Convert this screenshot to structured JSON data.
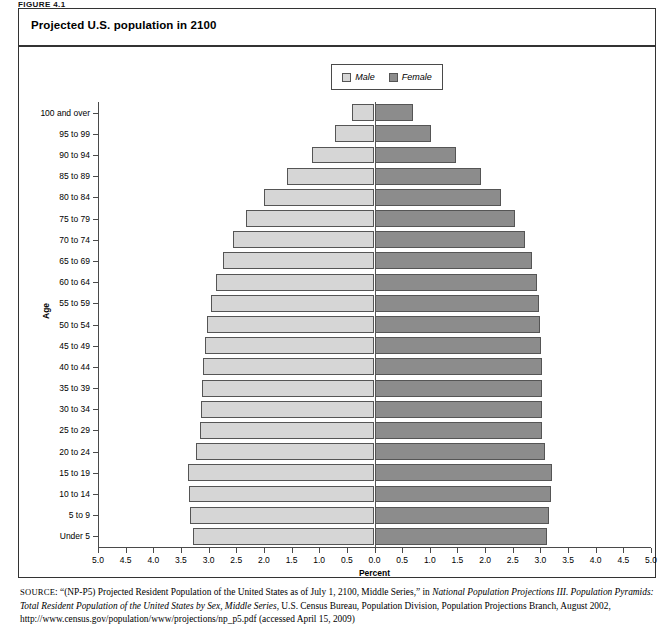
{
  "figure_label": "FIGURE 4.1",
  "title": "Projected U.S. population in 2100",
  "legend": {
    "male": "Male",
    "female": "Female"
  },
  "axes": {
    "xlabel": "Percent",
    "ylabel": "Age",
    "xticks": [
      "5.0",
      "4.5",
      "4.0",
      "3.5",
      "3.0",
      "2.5",
      "2.0",
      "1.5",
      "1.0",
      "0.5",
      "0.0",
      "0.5",
      "1.0",
      "1.5",
      "2.0",
      "2.5",
      "3.0",
      "3.5",
      "4.0",
      "4.5",
      "5.0"
    ],
    "xmax": 5.0
  },
  "colors": {
    "male": "#d6d6d6",
    "female": "#8c8c8c",
    "border": "#555555",
    "frame": "#333333"
  },
  "source": {
    "prefix": "SOURCE",
    "part1": ": “(NP-P5) Projected Resident Population of the United States as of July 1, 2100, Middle Series,” in ",
    "italic1": "National Population Projections III. Population Pyramids: Total Resident Population of the United States by Sex, Middle Series",
    "part2": ", U.S. Census Bureau, Population Division, Population Projections Branch, August 2002, http://www.census.gov/population/www/projections/np_p5.pdf (accessed April 15, 2009)"
  },
  "chart_data": {
    "type": "bar",
    "orientation": "population-pyramid",
    "title": "Projected U.S. population in 2100",
    "xlabel": "Percent",
    "ylabel": "Age",
    "xlim": [
      -5.0,
      5.0
    ],
    "grid": false,
    "legend_position": "top-center",
    "categories": [
      "Under 5",
      "5 to 9",
      "10 to 14",
      "15 to 19",
      "20 to 24",
      "25 to 29",
      "30 to 34",
      "35 to 39",
      "40 to 44",
      "45 to 49",
      "50 to 54",
      "55 to 59",
      "60 to 64",
      "65 to 69",
      "70 to 74",
      "75 to 79",
      "80 to 84",
      "85 to 89",
      "90 to 94",
      "95 to 99",
      "100 and over"
    ],
    "series": [
      {
        "name": "Male",
        "side": "left",
        "values": [
          3.29,
          3.33,
          3.36,
          3.38,
          3.22,
          3.15,
          3.14,
          3.12,
          3.1,
          3.07,
          3.02,
          2.96,
          2.87,
          2.74,
          2.56,
          2.32,
          2.0,
          1.58,
          1.13,
          0.72,
          0.4
        ]
      },
      {
        "name": "Female",
        "side": "right",
        "values": [
          3.12,
          3.16,
          3.19,
          3.21,
          3.08,
          3.03,
          3.03,
          3.02,
          3.02,
          3.01,
          2.99,
          2.97,
          2.93,
          2.85,
          2.72,
          2.54,
          2.28,
          1.92,
          1.48,
          1.03,
          0.7
        ]
      }
    ]
  }
}
